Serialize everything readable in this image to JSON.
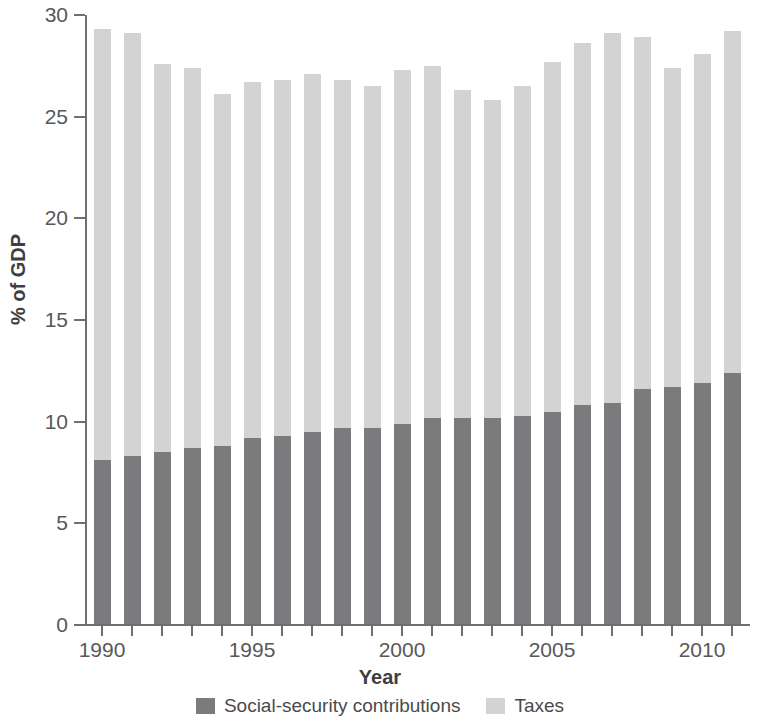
{
  "chart_data": {
    "type": "bar",
    "subtype": "stacked",
    "title": "",
    "xlabel": "Year",
    "ylabel": "% of GDP",
    "ylim": [
      0,
      30
    ],
    "y_ticks": [
      0,
      5,
      10,
      15,
      20,
      25,
      30
    ],
    "x_ticks_labeled": [
      "1990",
      "1995",
      "2000",
      "2005",
      "2010"
    ],
    "grid": false,
    "legend_position": "bottom",
    "categories": [
      "1990",
      "1991",
      "1992",
      "1993",
      "1994",
      "1995",
      "1996",
      "1997",
      "1998",
      "1999",
      "2000",
      "2001",
      "2002",
      "2003",
      "2004",
      "2005",
      "2006",
      "2007",
      "2008",
      "2009",
      "2010",
      "2011"
    ],
    "series": [
      {
        "name": "Social-security contributions",
        "color": "#7b7b7d",
        "values": [
          8.1,
          8.3,
          8.5,
          8.7,
          8.8,
          9.2,
          9.3,
          9.5,
          9.7,
          9.7,
          9.9,
          10.2,
          10.2,
          10.2,
          10.3,
          10.5,
          10.8,
          10.9,
          11.6,
          11.7,
          11.9,
          12.4
        ]
      },
      {
        "name": "Taxes",
        "color": "#d3d3d3",
        "values": [
          21.2,
          20.8,
          19.1,
          18.7,
          17.3,
          17.5,
          17.5,
          17.6,
          17.1,
          16.8,
          17.4,
          17.3,
          16.1,
          15.6,
          16.2,
          17.2,
          17.8,
          18.2,
          17.3,
          15.7,
          16.2,
          16.8
        ]
      }
    ],
    "totals": [
      29.3,
      29.1,
      27.6,
      27.4,
      26.1,
      26.7,
      26.8,
      27.1,
      26.8,
      26.5,
      27.3,
      27.5,
      26.3,
      25.8,
      26.5,
      27.7,
      28.6,
      29.1,
      28.9,
      27.4,
      28.1,
      29.2
    ]
  },
  "axes": {
    "y_title": "% of GDP",
    "x_title": "Year",
    "y_tick_labels": [
      "30",
      "25",
      "20",
      "15",
      "10",
      "5",
      "0"
    ],
    "x_tick_labels": [
      "1990",
      "1995",
      "2000",
      "2005",
      "2010"
    ]
  },
  "legend": {
    "items": [
      {
        "label": "Social-security contributions",
        "color": "#7b7b7d"
      },
      {
        "label": "Taxes",
        "color": "#d3d3d3"
      }
    ]
  }
}
